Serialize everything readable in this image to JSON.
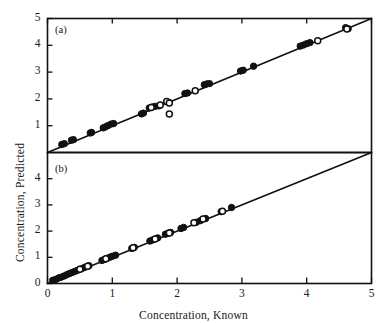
{
  "figure": {
    "xlabel": "Concentration, Known",
    "ylabel": "Concentration, Predicted",
    "panel_a_tag": "(a)",
    "panel_b_tag": "(b)"
  },
  "chart_data": [
    {
      "type": "scatter",
      "panel": "(a)",
      "title": "",
      "xlabel": "Concentration, Known",
      "ylabel": "Concentration, Predicted",
      "xlim": [
        0,
        5
      ],
      "ylim": [
        0,
        5
      ],
      "xticks": [
        0,
        1,
        2,
        3,
        4,
        5
      ],
      "yticks": [
        1,
        2,
        3,
        4,
        5
      ],
      "xticklabels": [
        "0",
        "1",
        "2",
        "3",
        "4",
        "5"
      ],
      "yticklabels": [
        "1",
        "2",
        "3",
        "4",
        "5"
      ],
      "grid": false,
      "legend": "none",
      "reference_line": {
        "name": "identity-line",
        "slope": 1,
        "intercept": 0,
        "x_from": 0,
        "x_to": 5
      },
      "series": [
        {
          "name": "Filled circles",
          "marker": "filled-circle",
          "points": [
            [
              0.22,
              0.3
            ],
            [
              0.26,
              0.33
            ],
            [
              0.37,
              0.46
            ],
            [
              0.4,
              0.48
            ],
            [
              0.66,
              0.73
            ],
            [
              0.68,
              0.75
            ],
            [
              0.86,
              0.92
            ],
            [
              0.89,
              0.95
            ],
            [
              0.93,
              1.0
            ],
            [
              0.98,
              1.06
            ],
            [
              1.02,
              1.08
            ],
            [
              1.45,
              1.44
            ],
            [
              1.48,
              1.47
            ],
            [
              1.57,
              1.66
            ],
            [
              1.62,
              1.7
            ],
            [
              1.66,
              1.72
            ],
            [
              1.72,
              1.74
            ],
            [
              1.88,
              1.86
            ],
            [
              2.12,
              2.2
            ],
            [
              2.16,
              2.22
            ],
            [
              2.42,
              2.53
            ],
            [
              2.46,
              2.56
            ],
            [
              2.5,
              2.57
            ],
            [
              2.98,
              3.04
            ],
            [
              3.02,
              3.07
            ],
            [
              3.18,
              3.22
            ],
            [
              3.9,
              3.97
            ],
            [
              3.95,
              4.01
            ],
            [
              4.0,
              4.06
            ],
            [
              4.05,
              4.1
            ],
            [
              4.6,
              4.66
            ],
            [
              4.64,
              4.62
            ]
          ]
        },
        {
          "name": "Open circles",
          "marker": "open-circle",
          "points": [
            [
              1.6,
              1.68
            ],
            [
              1.74,
              1.77
            ],
            [
              1.84,
              1.9
            ],
            [
              1.88,
              1.85
            ],
            [
              1.88,
              1.44
            ],
            [
              2.28,
              2.3
            ],
            [
              4.17,
              4.17
            ],
            [
              4.62,
              4.61
            ]
          ]
        }
      ]
    },
    {
      "type": "scatter",
      "panel": "(b)",
      "title": "",
      "xlabel": "Concentration, Known",
      "ylabel": "Concentration, Predicted",
      "xlim": [
        0,
        5
      ],
      "ylim": [
        0,
        5
      ],
      "xticks": [
        0,
        1,
        2,
        3,
        4,
        5
      ],
      "yticks": [
        0,
        1,
        2,
        3,
        4
      ],
      "xticklabels": [
        "0",
        "1",
        "2",
        "3",
        "4",
        "5"
      ],
      "yticklabels": [
        "0",
        "1",
        "2",
        "3",
        "4"
      ],
      "grid": false,
      "legend": "none",
      "reference_line": {
        "name": "identity-line",
        "slope": 1,
        "intercept": 0,
        "x_from": 0,
        "x_to": 5
      },
      "series": [
        {
          "name": "Filled circles",
          "marker": "filled-circle",
          "points": [
            [
              0.08,
              0.12
            ],
            [
              0.11,
              0.14
            ],
            [
              0.14,
              0.17
            ],
            [
              0.18,
              0.22
            ],
            [
              0.22,
              0.25
            ],
            [
              0.26,
              0.29
            ],
            [
              0.3,
              0.34
            ],
            [
              0.34,
              0.38
            ],
            [
              0.38,
              0.42
            ],
            [
              0.42,
              0.46
            ],
            [
              0.46,
              0.5
            ],
            [
              0.52,
              0.56
            ],
            [
              0.56,
              0.6
            ],
            [
              0.6,
              0.64
            ],
            [
              0.64,
              0.68
            ],
            [
              0.84,
              0.88
            ],
            [
              0.88,
              0.92
            ],
            [
              0.92,
              0.96
            ],
            [
              0.96,
              1.0
            ],
            [
              1.0,
              1.04
            ],
            [
              1.05,
              1.08
            ],
            [
              1.3,
              1.34
            ],
            [
              1.34,
              1.38
            ],
            [
              1.58,
              1.62
            ],
            [
              1.62,
              1.66
            ],
            [
              1.7,
              1.74
            ],
            [
              1.82,
              1.88
            ],
            [
              1.86,
              1.92
            ],
            [
              1.9,
              1.95
            ],
            [
              2.06,
              2.1
            ],
            [
              2.1,
              2.14
            ],
            [
              2.3,
              2.34
            ],
            [
              2.36,
              2.4
            ],
            [
              2.44,
              2.48
            ],
            [
              2.68,
              2.74
            ],
            [
              2.84,
              2.9
            ]
          ]
        },
        {
          "name": "Open circles",
          "marker": "open-circle",
          "points": [
            [
              0.5,
              0.54
            ],
            [
              0.62,
              0.66
            ],
            [
              0.9,
              0.94
            ],
            [
              1.32,
              1.36
            ],
            [
              1.66,
              1.7
            ],
            [
              1.88,
              1.93
            ],
            [
              2.26,
              2.32
            ],
            [
              2.4,
              2.46
            ],
            [
              2.7,
              2.76
            ]
          ]
        }
      ]
    }
  ],
  "colors": {
    "ink": "#111111",
    "marker_fill": "#111111",
    "marker_open_fill": "#ffffff",
    "background": "#ffffff"
  }
}
